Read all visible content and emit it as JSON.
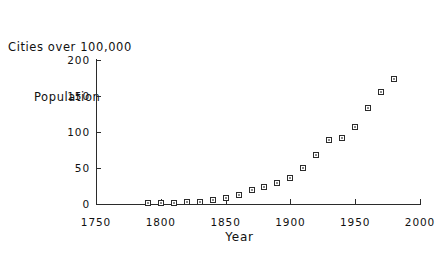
{
  "chart_data": {
    "type": "scatter",
    "title": "Cities over 100,000 Population",
    "title_line1": "Cities over 100,000",
    "title_line2": "Population",
    "xlabel": "Year",
    "ylabel": "",
    "xlim": [
      1750,
      2000
    ],
    "ylim": [
      0,
      200
    ],
    "xticks": [
      1750,
      1800,
      1850,
      1900,
      1950,
      2000
    ],
    "xticklabels": [
      "1750",
      "1800",
      "1850",
      "1900",
      "1950",
      "2000"
    ],
    "yticks": [
      0,
      50,
      100,
      150,
      200
    ],
    "yticklabels": [
      "0",
      "50",
      "100",
      "150",
      "200"
    ],
    "grid": false,
    "legend": null,
    "marker": "open-square",
    "marker_color": "#2b2b2b",
    "x": [
      1790,
      1800,
      1810,
      1820,
      1830,
      1840,
      1850,
      1860,
      1870,
      1880,
      1890,
      1900,
      1910,
      1920,
      1930,
      1940,
      1950,
      1960,
      1970,
      1980
    ],
    "y": [
      1,
      2,
      2,
      3,
      3,
      5,
      8,
      13,
      19,
      24,
      29,
      36,
      50,
      68,
      89,
      91,
      107,
      133,
      156,
      174
    ],
    "series": [
      {
        "name": "Cities over 100,000 Population",
        "points": [
          {
            "x": 1790,
            "y": 1
          },
          {
            "x": 1800,
            "y": 2
          },
          {
            "x": 1810,
            "y": 2
          },
          {
            "x": 1820,
            "y": 3
          },
          {
            "x": 1830,
            "y": 3
          },
          {
            "x": 1840,
            "y": 5
          },
          {
            "x": 1850,
            "y": 8
          },
          {
            "x": 1860,
            "y": 13
          },
          {
            "x": 1870,
            "y": 19
          },
          {
            "x": 1880,
            "y": 24
          },
          {
            "x": 1890,
            "y": 29
          },
          {
            "x": 1900,
            "y": 36
          },
          {
            "x": 1910,
            "y": 50
          },
          {
            "x": 1920,
            "y": 68
          },
          {
            "x": 1930,
            "y": 89
          },
          {
            "x": 1940,
            "y": 91
          },
          {
            "x": 1950,
            "y": 107
          },
          {
            "x": 1960,
            "y": 133
          },
          {
            "x": 1970,
            "y": 156
          },
          {
            "x": 1980,
            "y": 174
          }
        ]
      }
    ]
  }
}
